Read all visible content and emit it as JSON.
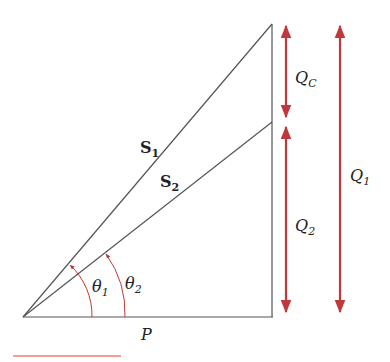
{
  "diagram": {
    "type": "power-triangle",
    "colors": {
      "line": "#555555",
      "arrow": "#c0383c",
      "bottom_rule": "#f08070"
    },
    "labels": {
      "S1": {
        "main": "S",
        "sub": "1"
      },
      "S2": {
        "main": "S",
        "sub": "2"
      },
      "theta1": {
        "main": "θ",
        "sub": "1"
      },
      "theta2": {
        "main": "θ",
        "sub": "2"
      },
      "P": {
        "main": "P"
      },
      "QC": {
        "main": "Q",
        "sub": "C"
      },
      "Q1": {
        "main": "Q",
        "sub": "1"
      },
      "Q2": {
        "main": "Q",
        "sub": "2"
      }
    }
  }
}
